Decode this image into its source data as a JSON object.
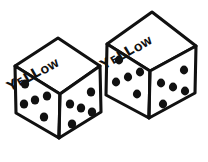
{
  "image": {
    "title": "Two hand-drawn dice labeled YELLOW",
    "style": "black ink line drawing on white",
    "background_color": "#ffffff",
    "ink_color": "#111111",
    "width": 208,
    "height": 162
  },
  "dice": [
    {
      "id": "left-die",
      "position": "left",
      "top_face": {
        "label": "YELLOW",
        "label_letters": [
          "Y",
          "E",
          "L",
          "L",
          "O",
          "W"
        ]
      },
      "faces": [
        {
          "name": "left-face",
          "pips": 5,
          "pattern": "quincunx"
        },
        {
          "name": "right-face",
          "pips": 5,
          "pattern": "quincunx"
        }
      ],
      "visible_pip_total": 10
    },
    {
      "id": "right-die",
      "position": "right",
      "top_face": {
        "label": "YELLOW",
        "label_letters": [
          "Y",
          "E",
          "L",
          "L",
          "O",
          "W"
        ]
      },
      "faces": [
        {
          "name": "left-face",
          "pips": 5,
          "pattern": "quincunx"
        },
        {
          "name": "right-face",
          "pips": 5,
          "pattern": "quincunx"
        }
      ],
      "visible_pip_total": 10
    }
  ]
}
